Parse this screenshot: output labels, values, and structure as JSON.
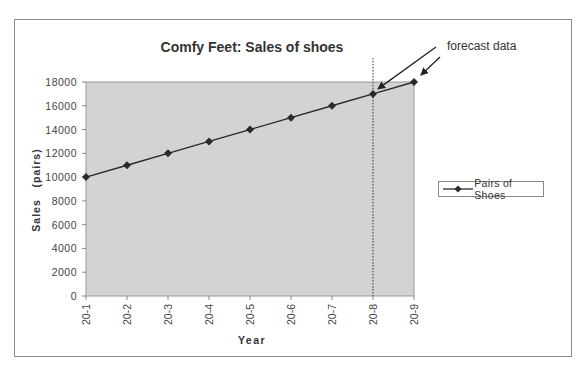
{
  "chart_data": {
    "type": "line",
    "title": "Comfy Feet: Sales of shoes",
    "xlabel": "Year",
    "ylabel": "Sales   (pairs)",
    "categories": [
      "20-1",
      "20-2",
      "20-3",
      "20-4",
      "20-5",
      "20-6",
      "20-7",
      "20-8",
      "20-9"
    ],
    "series": [
      {
        "name": "Pairs of Shoes",
        "values": [
          10000,
          11000,
          12000,
          13000,
          14000,
          15000,
          16000,
          17000,
          18000
        ],
        "color": "#2a2a2a",
        "marker": "diamond"
      }
    ],
    "yticks": [
      0,
      2000,
      4000,
      6000,
      8000,
      10000,
      12000,
      14000,
      16000,
      18000
    ],
    "ylim": [
      0,
      18000
    ],
    "grid": false,
    "plot_background": "#d3d3d3",
    "legend_position": "right",
    "annotations": [
      {
        "text": "forecast data",
        "points_to": [
          "20-8",
          "20-9"
        ]
      }
    ],
    "forecast_divider_at": "20-8"
  },
  "legend": {
    "label": "Pairs of Shoes"
  },
  "annotation": {
    "text": "forecast data"
  }
}
